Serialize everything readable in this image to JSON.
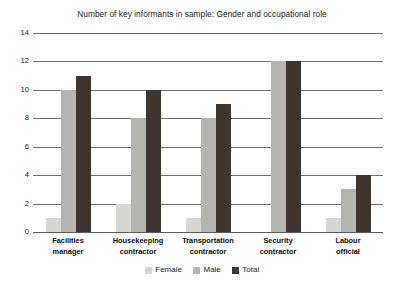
{
  "chart_data": {
    "type": "bar",
    "title": "Number of key informants in sample: Gender and occupational role",
    "xlabel": "",
    "ylabel": "",
    "ylim": [
      0,
      14
    ],
    "ytick_step": 2,
    "yticks": [
      14,
      12,
      10,
      8,
      6,
      4,
      2,
      0
    ],
    "grid": true,
    "legend_position": "bottom-center",
    "categories": [
      "Facilities manager",
      "Housekeeping contractor",
      "Transportation contractor",
      "Security contractor",
      "Labour official"
    ],
    "category_lines": [
      [
        "Facilities",
        "manager"
      ],
      [
        "Housekeeping",
        "contractor"
      ],
      [
        "Transportation",
        "contractor"
      ],
      [
        "Security",
        "contractor"
      ],
      [
        "Labour",
        "official"
      ]
    ],
    "series": [
      {
        "name": "Female",
        "color": "#d6d6d4",
        "values": [
          1,
          2,
          1,
          0,
          1
        ]
      },
      {
        "name": "Male",
        "color": "#b4b4b1",
        "values": [
          10,
          8,
          8,
          12,
          3
        ]
      },
      {
        "name": "Total",
        "color": "#3e3430",
        "values": [
          11,
          10,
          9,
          12,
          4
        ]
      }
    ]
  }
}
